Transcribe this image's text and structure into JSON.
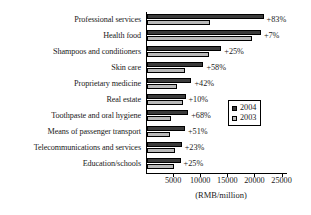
{
  "chart_data": {
    "type": "bar",
    "orientation": "horizontal",
    "title": "",
    "xlabel": "(RMB/million)",
    "ylabel": "",
    "xlim": [
      0,
      26000
    ],
    "grid": false,
    "legend_position": "middle-right",
    "xticks": [
      5000,
      10000,
      15000,
      20000,
      25000
    ],
    "xtick_labels": [
      "5000",
      "10000",
      "15000",
      "20000",
      "25000"
    ],
    "categories": [
      "Professional services",
      "Health food",
      "Shampoos and conditioners",
      "Skin care",
      "Proprietary medicine",
      "Real estate",
      "Toothpaste and oral hygiene",
      "Means of passenger transport",
      "Telecommunications and services",
      "Education/schools"
    ],
    "series": [
      {
        "name": "2004",
        "color": "#3b3b3b",
        "values": [
          21500,
          21000,
          13700,
          10400,
          8200,
          7100,
          7600,
          7000,
          6400,
          6200
        ]
      },
      {
        "name": "2003",
        "color": "#b9b9b9",
        "values": [
          11600,
          19400,
          11400,
          7000,
          5500,
          6700,
          4400,
          4200,
          5100,
          5000
        ]
      }
    ],
    "annotations": [
      "+83%",
      "+7%",
      "+25%",
      "+58%",
      "+42%",
      "+10%",
      "+68%",
      "+51%",
      "+23%",
      "+25%"
    ]
  },
  "legend": {
    "entries": [
      {
        "label": "2004"
      },
      {
        "label": "2003"
      }
    ]
  }
}
